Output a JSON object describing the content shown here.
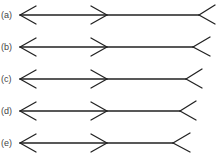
{
  "figure": {
    "stroke_color": "#222222",
    "rows": [
      {
        "label": "(a)",
        "y": 15,
        "left_tip_x": 20,
        "mid_tip_x": 107,
        "right_vertex_x": 199,
        "right_end_x": 215
      },
      {
        "label": "(b)",
        "y": 47,
        "left_tip_x": 20,
        "mid_tip_x": 107,
        "right_vertex_x": 193,
        "right_end_x": 210
      },
      {
        "label": "(c)",
        "y": 79,
        "left_tip_x": 20,
        "mid_tip_x": 107,
        "right_vertex_x": 186,
        "right_end_x": 202
      },
      {
        "label": "(d)",
        "y": 111,
        "left_tip_x": 20,
        "mid_tip_x": 107,
        "right_vertex_x": 180,
        "right_end_x": 196
      },
      {
        "label": "(e)",
        "y": 143,
        "left_tip_x": 20,
        "mid_tip_x": 107,
        "right_vertex_x": 173,
        "right_end_x": 190
      }
    ]
  }
}
